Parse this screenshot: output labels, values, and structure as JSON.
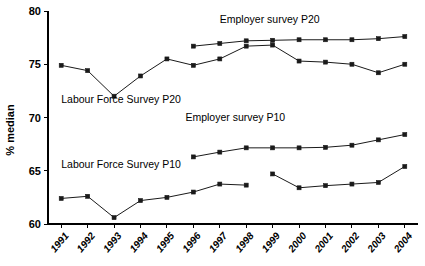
{
  "chart_data": {
    "type": "line",
    "title": "",
    "xlabel": "",
    "ylabel": "% median",
    "ylim": [
      60,
      80
    ],
    "yticks": [
      60,
      65,
      70,
      75,
      80
    ],
    "grid": false,
    "legend_position": "inline-annotations",
    "categories": [
      "1991",
      "1992",
      "1993",
      "1994",
      "1995",
      "1996",
      "1997",
      "1998",
      "1999",
      "2000",
      "2001",
      "2002",
      "2003",
      "2004"
    ],
    "series": [
      {
        "name": "Labour Force Survey P20",
        "marker": "square",
        "values": [
          74.9,
          74.4,
          72.0,
          73.9,
          75.5,
          74.9,
          75.5,
          76.7,
          76.8,
          75.3,
          75.2,
          75.0,
          74.2,
          75.0
        ]
      },
      {
        "name": "Employer survey P20",
        "marker": "square",
        "values": [
          null,
          null,
          null,
          null,
          null,
          76.7,
          76.95,
          77.2,
          77.25,
          77.3,
          77.3,
          77.3,
          77.4,
          77.6
        ]
      },
      {
        "name": "Employer survey P10",
        "marker": "square",
        "values": [
          null,
          null,
          null,
          null,
          null,
          66.3,
          66.75,
          67.15,
          67.15,
          67.15,
          67.2,
          67.4,
          67.9,
          68.4
        ]
      },
      {
        "name": "Labour Force Survey P10",
        "marker": "square",
        "values": [
          62.4,
          62.6,
          60.6,
          62.2,
          62.5,
          63.0,
          63.75,
          63.65,
          64.7,
          63.4,
          63.6,
          63.75,
          63.9,
          65.4
        ]
      }
    ],
    "series_breaks": [
      {
        "series": "Labour Force Survey P10",
        "between": [
          "1998",
          "1999"
        ]
      }
    ],
    "annotations": [
      {
        "text": "Employer survey P20",
        "x": 1997.0,
        "y": 78.85
      },
      {
        "text": "Labour Force Survey P20",
        "x": 1991.0,
        "y": 71.35
      },
      {
        "text": "Employer survey P10",
        "x": 1995.7,
        "y": 69.65
      },
      {
        "text": "Labour Force Survey P10",
        "x": 1991.0,
        "y": 65.3
      }
    ]
  },
  "axis": {
    "y_tick_labels": [
      "80",
      "75",
      "70",
      "65",
      "60"
    ],
    "x_tick_labels": [
      "1991",
      "1992",
      "1993",
      "1994",
      "1995",
      "1996",
      "1997",
      "1998",
      "1999",
      "2000",
      "2001",
      "2002",
      "2003",
      "2004"
    ]
  },
  "colors": {
    "line": "#1a1a1a",
    "axis": "#000000",
    "background": "#ffffff"
  }
}
